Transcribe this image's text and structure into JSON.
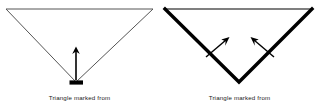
{
  "figure": {
    "background_color": "#ffffff",
    "panel_count": 2,
    "panels": [
      {
        "id": "left",
        "caption": "Triangle marked from",
        "shape": {
          "name": "inverted-triangle",
          "orientation": "point-down",
          "top_edge_style": "thin",
          "leg_style": "thin",
          "thin_stroke_color": "#555555",
          "thick_stroke_color": "#000000",
          "thin_stroke_width": 1,
          "thick_stroke_width": 3.2,
          "marked_region": "bottom-vertex"
        },
        "marker": {
          "name": "vertex-mark",
          "style": "short-thick-horizontal-bar",
          "color": "#000000"
        },
        "arrows": [
          {
            "name": "vertex-arrow",
            "direction": "up",
            "from_x": 76,
            "from_y": 82,
            "to_x": 76,
            "to_y": 48
          }
        ]
      },
      {
        "id": "right",
        "caption": "Triangle marked from",
        "shape": {
          "name": "inverted-triangle",
          "orientation": "point-down",
          "top_edge_style": "thin",
          "leg_style": "thick",
          "thin_stroke_color": "#555555",
          "thick_stroke_color": "#000000",
          "thin_stroke_width": 1,
          "thick_stroke_width": 3.2,
          "marked_region": "two-slanted-legs"
        },
        "marker": null,
        "arrows": [
          {
            "name": "left-leg-arrow",
            "direction": "up-right",
            "from_x": 47,
            "from_y": 56,
            "to_x": 69,
            "to_y": 38
          },
          {
            "name": "right-leg-arrow",
            "direction": "up-left",
            "from_x": 113,
            "from_y": 56,
            "to_x": 91,
            "to_y": 38
          }
        ]
      }
    ]
  }
}
